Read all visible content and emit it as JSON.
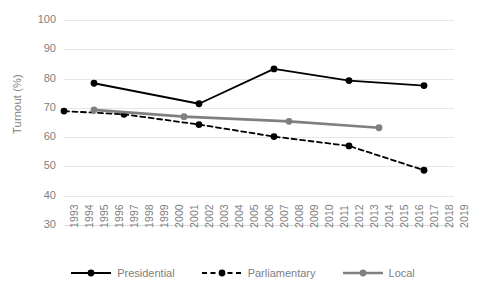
{
  "chart_data": {
    "type": "line",
    "title": "",
    "xlabel": "",
    "ylabel": "Turnout (%)",
    "ylim": [
      30,
      100
    ],
    "ytick_step": 10,
    "yticks": [
      100,
      90,
      80,
      70,
      60,
      50,
      40,
      30
    ],
    "xticks": [
      1993,
      1994,
      1995,
      1996,
      1997,
      1998,
      1999,
      2000,
      2001,
      2002,
      2003,
      2004,
      2005,
      2006,
      2007,
      2008,
      2009,
      2010,
      2011,
      2012,
      2013,
      2014,
      2015,
      2016,
      2017,
      2018,
      2019
    ],
    "xlim": [
      1993,
      2019
    ],
    "grid": "horizontal",
    "legend_position": "bottom",
    "series": [
      {
        "name": "Presidential",
        "style": "solid",
        "color": "#000000",
        "marker": "circle",
        "x": [
          1995,
          2002,
          2007,
          2012,
          2017
        ],
        "values": [
          78.4,
          71.4,
          83.3,
          79.3,
          77.6
        ]
      },
      {
        "name": "Parliamentary",
        "style": "dashed",
        "color": "#000000",
        "marker": "circle",
        "x": [
          1993,
          1997,
          2002,
          2007,
          2012,
          2017
        ],
        "values": [
          68.9,
          67.8,
          64.3,
          60.2,
          57.0,
          48.7
        ]
      },
      {
        "name": "Local",
        "style": "solid",
        "color": "#808080",
        "marker": "circle",
        "x": [
          1995,
          2001,
          2008,
          2014
        ],
        "values": [
          69.3,
          67.0,
          65.4,
          63.2
        ]
      }
    ]
  },
  "legend": {
    "items": [
      {
        "label": "Presidential"
      },
      {
        "label": "Parliamentary"
      },
      {
        "label": "Local"
      }
    ]
  },
  "axes": {
    "y_title": "Turnout (%)"
  },
  "colors": {
    "series_dark": "#000000",
    "series_gray": "#808080",
    "gridline": "#e6e6e6",
    "tick_text": "#808080",
    "background": "#ffffff"
  }
}
